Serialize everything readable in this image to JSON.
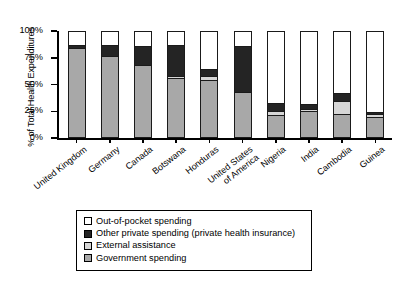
{
  "chart_data": {
    "type": "bar",
    "subtype": "stacked-bar-100-percent",
    "title": "",
    "xlabel": "",
    "ylabel": "% of Total Health Expenditures",
    "ylim": [
      0,
      100
    ],
    "yticks": [
      0,
      25,
      50,
      75,
      100
    ],
    "ytick_labels": [
      "0%",
      "25%",
      "50%",
      "75%",
      "100%"
    ],
    "grid": false,
    "legend_position": "below-plot",
    "categories": [
      "United Kingdom",
      "Germany",
      "Canada",
      "Botswana",
      "Honduras",
      "United States\nof America",
      "Nigeria",
      "India",
      "Cambodia",
      "Guinea"
    ],
    "series": [
      {
        "name": "Government spending",
        "color": "#a8a8a8",
        "values": [
          85,
          77,
          69,
          56,
          54,
          43,
          21,
          25,
          22,
          19
        ]
      },
      {
        "name": "External assistance",
        "color": "#d6d6d6",
        "values": [
          0,
          0,
          0,
          2,
          4,
          0,
          4,
          2,
          12,
          3
        ]
      },
      {
        "name": "Other private spending (private health insurance)",
        "color": "#242424",
        "values": [
          3,
          11,
          18,
          30,
          7,
          44,
          7,
          4,
          8,
          2
        ]
      },
      {
        "name": "Out-of-pocket spending",
        "color": "#ffffff",
        "values": [
          12,
          12,
          13,
          12,
          35,
          13,
          68,
          69,
          58,
          76
        ]
      }
    ]
  },
  "legend": {
    "items": [
      {
        "label": "Out-of-pocket spending",
        "color": "#ffffff"
      },
      {
        "label": "Other private spending (private health insurance)",
        "color": "#242424"
      },
      {
        "label": "External assistance",
        "color": "#d6d6d6"
      },
      {
        "label": "Government spending",
        "color": "#a8a8a8"
      }
    ]
  }
}
